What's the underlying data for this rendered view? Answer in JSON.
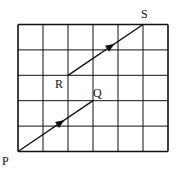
{
  "diagram": {
    "grid": {
      "cols": 6,
      "rows": 5,
      "x0": 18,
      "y0": 24.5,
      "cell_w": 25,
      "cell_h": 25.4
    },
    "points": {
      "P": {
        "label": "P",
        "gx": 0,
        "gy": 0
      },
      "Q": {
        "label": "Q",
        "gx": 3,
        "gy": 2
      },
      "R": {
        "label": "R",
        "gx": 2,
        "gy": 3
      },
      "S": {
        "label": "S",
        "gx": 5,
        "gy": 5
      }
    },
    "vectors": [
      {
        "from": "P",
        "to": "Q",
        "name": "PQ"
      },
      {
        "from": "R",
        "to": "S",
        "name": "RS"
      }
    ],
    "colors": {
      "line": "#111111",
      "background": "#ffffff"
    }
  }
}
